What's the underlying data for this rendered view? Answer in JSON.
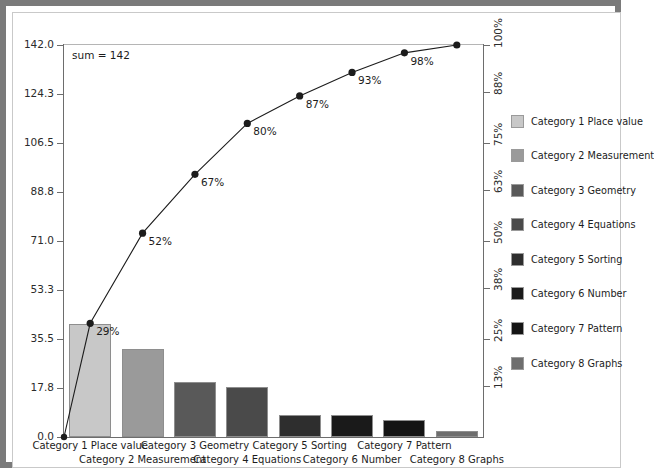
{
  "chart_data": {
    "type": "bar",
    "title": "",
    "subtitle": "",
    "xlabel": "",
    "ylabel": "",
    "annotation": "sum = 142",
    "grid": false,
    "legend_position": "right",
    "categories": [
      "Category 1 Place value",
      "Category 2 Measurement",
      "Category 3 Geometry",
      "Category 4 Equations",
      "Category 5 Sorting",
      "Category 6 Number",
      "Category 7 Pattern",
      "Category 8 Graphs"
    ],
    "series": [
      {
        "name": "Count",
        "type": "bar",
        "values": [
          41,
          32,
          20,
          18,
          8,
          8,
          6,
          2
        ]
      },
      {
        "name": "Cumulative %",
        "type": "line",
        "values": [
          29,
          52,
          67,
          80,
          87,
          93,
          98,
          100
        ],
        "labels": [
          "29%",
          "52%",
          "67%",
          "80%",
          "87%",
          "93%",
          "98%",
          "100%"
        ]
      }
    ],
    "total": 142,
    "ylim": [
      0,
      142
    ],
    "ylim_right": [
      0,
      100
    ],
    "yticks": [
      "0.0",
      "17.8",
      "35.5",
      "53.3",
      "71.0",
      "88.8",
      "106.5",
      "124.3",
      "142.0"
    ],
    "ytick_values": [
      0.0,
      17.8,
      35.5,
      53.3,
      71.0,
      88.8,
      106.5,
      124.3,
      142.0
    ],
    "yticks_right": [
      "13%",
      "25%",
      "38%",
      "50%",
      "63%",
      "75%",
      "88%",
      "100%"
    ],
    "ytick_values_right": [
      13,
      25,
      38,
      50,
      63,
      75,
      88,
      100
    ],
    "bar_colors": [
      "#c8c8c8",
      "#9a9a9a",
      "#595959",
      "#4a4a4a",
      "#2e2e2e",
      "#1a1a1a",
      "#141414",
      "#6e6e6e"
    ],
    "line_color": "#1c1c1c",
    "marker_color": "#1c1c1c",
    "axis_color": "#6d6d6d",
    "frame_color": "#7a7a7a",
    "background": "#ffffff"
  },
  "legend": {
    "items": [
      {
        "label": "Category 1 Place value",
        "color": "#c8c8c8"
      },
      {
        "label": "Category 2 Measurement",
        "color": "#9a9a9a"
      },
      {
        "label": "Category 3 Geometry",
        "color": "#595959"
      },
      {
        "label": "Category 4 Equations",
        "color": "#4a4a4a"
      },
      {
        "label": "Category 5 Sorting",
        "color": "#2e2e2e"
      },
      {
        "label": "Category 6 Number",
        "color": "#1a1a1a"
      },
      {
        "label": "Category 7 Pattern",
        "color": "#141414"
      },
      {
        "label": "Category 8 Graphs",
        "color": "#6e6e6e"
      }
    ]
  }
}
